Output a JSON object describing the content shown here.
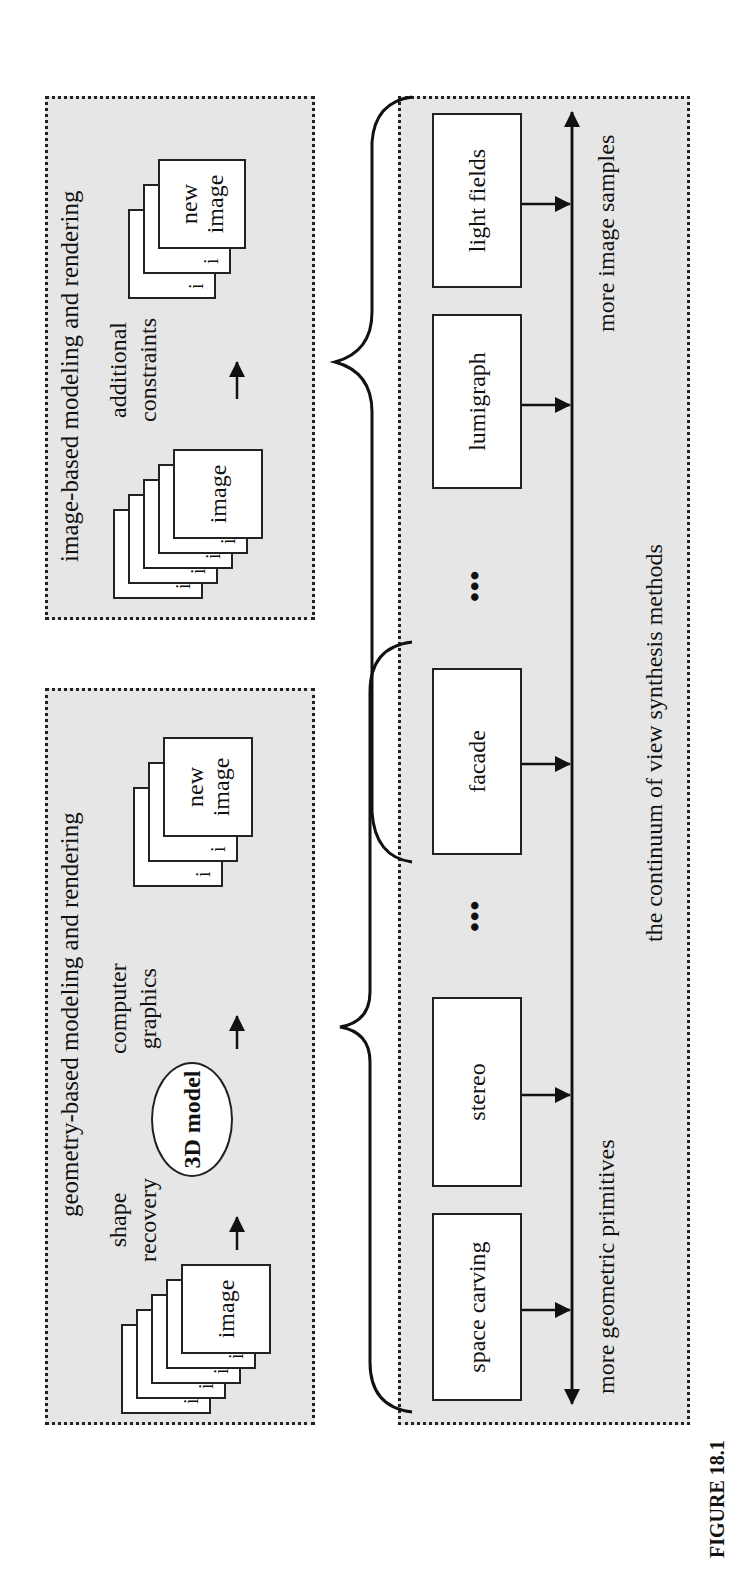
{
  "figure_label": "FIGURE 18.1",
  "geometry_panel": {
    "title": "geometry-based modeling and rendering",
    "input_stack": {
      "peek_label": "i",
      "front_label": "image",
      "count": 5
    },
    "step1_label_line1": "shape",
    "step1_label_line2": "recovery",
    "model_label": "3D model",
    "step2_label_line1": "computer",
    "step2_label_line2": "graphics",
    "output_stack": {
      "peek_label": "i",
      "front_label_line1": "new",
      "front_label_line2": "image",
      "count": 3
    }
  },
  "image_panel": {
    "title": "image-based modeling and rendering",
    "input_stack": {
      "peek_label": "i",
      "front_label": "image",
      "count": 5
    },
    "step_label_line1": "additional",
    "step_label_line2": "constraints",
    "output_stack": {
      "peek_label": "i",
      "front_label_line1": "new",
      "front_label_line2": "image",
      "count": 3
    }
  },
  "continuum_panel": {
    "methods": [
      {
        "label": "space carving"
      },
      {
        "label": "stereo"
      },
      {
        "label": "facade"
      },
      {
        "label": "lumigraph"
      },
      {
        "label": "light fields"
      }
    ],
    "ellipsis": "•••",
    "left_axis_label": "more geometric primitives",
    "right_axis_label": "more image samples",
    "caption": "the continuum of view synthesis methods"
  },
  "colors": {
    "panel_bg": "#e6e6e6",
    "stroke": "#222222",
    "box_bg": "#ffffff"
  }
}
